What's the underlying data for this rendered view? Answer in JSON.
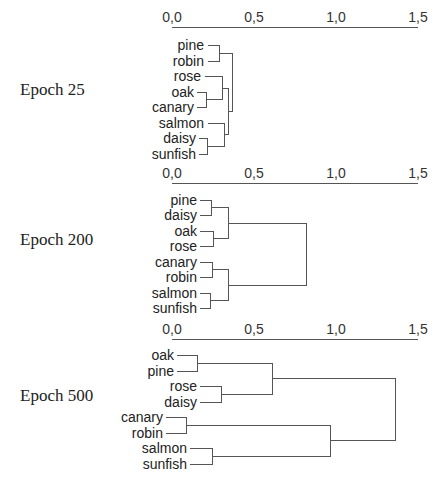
{
  "axis": {
    "ticks": [
      "0,0",
      "0,5",
      "1,0",
      "1,5"
    ],
    "tick_values": [
      0.0,
      0.5,
      1.0,
      1.5
    ],
    "range": [
      0,
      1.5
    ]
  },
  "panels": [
    {
      "label": "Epoch 25",
      "leaves": [
        "pine",
        "robin",
        "rose",
        "oak",
        "canary",
        "salmon",
        "daisy",
        "sunfish"
      ],
      "merges": [
        {
          "a": "pine",
          "b": "robin",
          "height": 0.29
        },
        {
          "a": "oak",
          "b": "canary",
          "height": 0.21
        },
        {
          "a": "rose",
          "b": "oak+canary",
          "height": 0.3
        },
        {
          "a": "daisy",
          "b": "sunfish",
          "height": 0.21
        },
        {
          "a": "salmon",
          "b": "daisy+sunfish",
          "height": 0.31
        },
        {
          "a": "rose+oak+canary",
          "b": "salmon+daisy+sunfish",
          "height": 0.34
        },
        {
          "a": "pine+robin",
          "b": "rest",
          "height": 0.37
        }
      ]
    },
    {
      "label": "Epoch 200",
      "leaves": [
        "pine",
        "daisy",
        "oak",
        "rose",
        "canary",
        "robin",
        "salmon",
        "sunfish"
      ],
      "merges": [
        {
          "a": "pine",
          "b": "daisy",
          "height": 0.24
        },
        {
          "a": "oak",
          "b": "rose",
          "height": 0.25
        },
        {
          "a": "pine+daisy",
          "b": "oak+rose",
          "height": 0.34
        },
        {
          "a": "canary",
          "b": "robin",
          "height": 0.24
        },
        {
          "a": "salmon",
          "b": "sunfish",
          "height": 0.23
        },
        {
          "a": "canary+robin",
          "b": "salmon+sunfish",
          "height": 0.34
        },
        {
          "a": "plants",
          "b": "animals",
          "height": 0.82
        }
      ]
    },
    {
      "label": "Epoch 500",
      "leaves": [
        "oak",
        "pine",
        "rose",
        "daisy",
        "canary",
        "robin",
        "salmon",
        "sunfish"
      ],
      "merges": [
        {
          "a": "oak",
          "b": "pine",
          "height": 0.15
        },
        {
          "a": "rose",
          "b": "daisy",
          "height": 0.3
        },
        {
          "a": "oak+pine",
          "b": "rose+daisy",
          "height": 0.61
        },
        {
          "a": "canary",
          "b": "robin",
          "height": 0.09
        },
        {
          "a": "salmon",
          "b": "sunfish",
          "height": 0.24
        },
        {
          "a": "canary+robin",
          "b": "salmon+sunfish",
          "height": 0.96
        },
        {
          "a": "plants",
          "b": "animals",
          "height": 1.36
        }
      ]
    }
  ]
}
